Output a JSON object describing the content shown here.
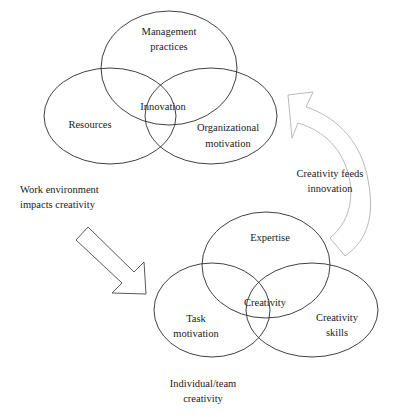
{
  "diagram": {
    "type": "two-venn-with-arrows",
    "stroke_color": "#2b2b2b",
    "arrow_color": "#b9b9b9",
    "text_color": "#1a1a1a",
    "background": "#ffffff"
  },
  "organizational_venn": {
    "name": "organizational-innovation-venn",
    "caption": "Innovation",
    "center_label": "Innovation",
    "circles": [
      {
        "id": "management-practices",
        "label_line1": "Management",
        "label_line2": "practices",
        "position": "top"
      },
      {
        "id": "resources",
        "label_line1": "Resources",
        "label_line2": "",
        "position": "left"
      },
      {
        "id": "organizational-motivation",
        "label_line1": "Organizational",
        "label_line2": "motivation",
        "position": "right"
      }
    ]
  },
  "individual_venn": {
    "name": "individual-creativity-venn",
    "center_label": "Creativity",
    "caption_line1": "Individual/team",
    "caption_line2": "creativity",
    "circles": [
      {
        "id": "expertise",
        "label_line1": "Expertise",
        "label_line2": "",
        "position": "top"
      },
      {
        "id": "task-motivation",
        "label_line1": "Task",
        "label_line2": "motivation",
        "position": "left"
      },
      {
        "id": "creativity-skills",
        "label_line1": "Creativity",
        "label_line2": "skills",
        "position": "right"
      }
    ]
  },
  "arrows": [
    {
      "id": "work-environment-arrow",
      "direction": "down-right",
      "shape": "straight",
      "label_line1": "Work environment",
      "label_line2": "impacts creativity"
    },
    {
      "id": "creativity-feeds-arrow",
      "direction": "up-left",
      "shape": "curved",
      "label_line1": "Creativity feeds",
      "label_line2": "innovation"
    }
  ]
}
